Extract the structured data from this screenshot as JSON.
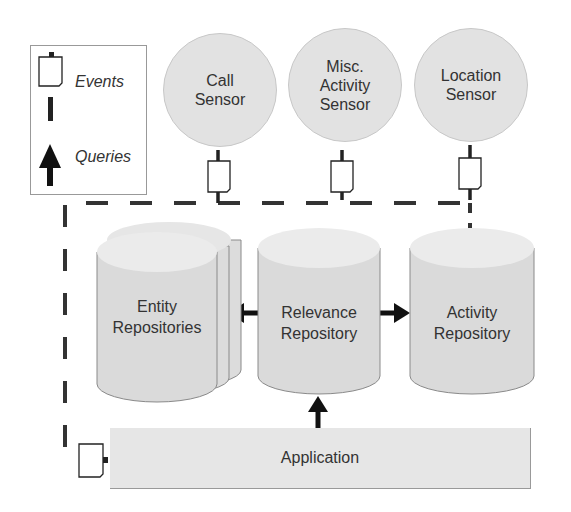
{
  "legend": {
    "events_label": "Events",
    "queries_label": "Queries"
  },
  "sensors": [
    {
      "label": "Call\nSensor"
    },
    {
      "label": "Misc.\nActivity\nSensor"
    },
    {
      "label": "Location\nSensor"
    }
  ],
  "repositories": [
    {
      "label": "Entity\nRepositories"
    },
    {
      "label": "Relevance\nRepository"
    },
    {
      "label": "Activity\nRepository"
    }
  ],
  "application": {
    "label": "Application"
  },
  "colors": {
    "fill": "#e2e2e2",
    "stroke": "#222222",
    "dash": "#333333"
  }
}
